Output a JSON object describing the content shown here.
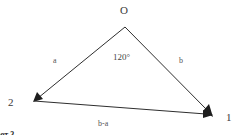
{
  "diagram": {
    "type": "vector-triangle",
    "points": {
      "origin": {
        "label": "O"
      },
      "p2": {
        "label": "2"
      },
      "p1": {
        "label": "1"
      }
    },
    "vectors": [
      {
        "id": "a",
        "label": "a",
        "from": "O",
        "to": "2"
      },
      {
        "id": "b",
        "label": "b",
        "from": "O",
        "to": "1"
      },
      {
        "id": "b-a",
        "label": "b-a",
        "from": "2",
        "to": "1"
      }
    ],
    "angle": {
      "label": "120°",
      "at": "O",
      "degrees": 120
    },
    "caption": {
      "partial_text": "рот 3"
    },
    "colors": {
      "line": "#2e2e2e",
      "arrowhead": "#1e1e1e",
      "text": "#3a3a3a",
      "background": "#ffffff"
    }
  }
}
